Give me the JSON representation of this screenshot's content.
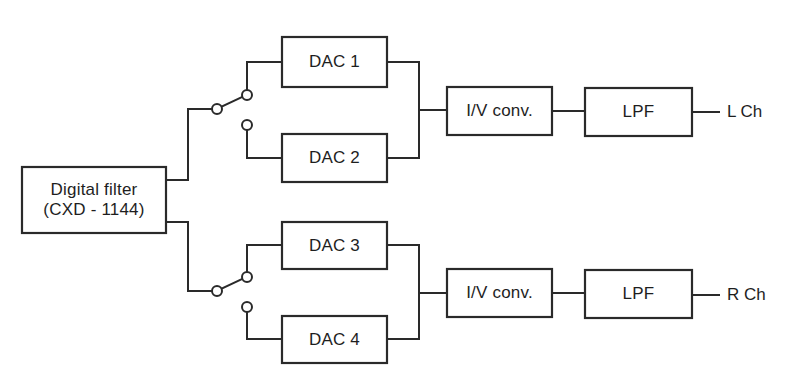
{
  "diagram": {
    "type": "block-diagram",
    "colors": {
      "line": "#2a2a2a",
      "text": "#1e1e1e",
      "background": "#ffffff"
    },
    "blocks": {
      "digital_filter": {
        "line1": "Digital filter",
        "line2": "(CXD - 1144)"
      },
      "dac1": {
        "label": "DAC 1"
      },
      "dac2": {
        "label": "DAC 2"
      },
      "dac3": {
        "label": "DAC 3"
      },
      "dac4": {
        "label": "DAC 4"
      },
      "iv_left": {
        "label": "I/V conv."
      },
      "iv_right": {
        "label": "I/V conv."
      },
      "lpf_left": {
        "label": "LPF"
      },
      "lpf_right": {
        "label": "LPF"
      }
    },
    "outputs": {
      "left": {
        "label": "L Ch"
      },
      "right": {
        "label": "R Ch"
      }
    },
    "switches": [
      {
        "name": "upper-switch",
        "position": "DAC 1",
        "contacts": [
          "DAC 1",
          "DAC 2"
        ]
      },
      {
        "name": "lower-switch",
        "position": "DAC 3",
        "contacts": [
          "DAC 3",
          "DAC 4"
        ]
      }
    ],
    "connections": [
      [
        "Digital filter",
        "upper-switch"
      ],
      [
        "Digital filter",
        "lower-switch"
      ],
      [
        "upper-switch",
        "DAC 1"
      ],
      [
        "upper-switch",
        "DAC 2"
      ],
      [
        "lower-switch",
        "DAC 3"
      ],
      [
        "lower-switch",
        "DAC 4"
      ],
      [
        "DAC 1",
        "I/V conv. (L)"
      ],
      [
        "DAC 2",
        "I/V conv. (L)"
      ],
      [
        "DAC 3",
        "I/V conv. (R)"
      ],
      [
        "DAC 4",
        "I/V conv. (R)"
      ],
      [
        "I/V conv. (L)",
        "LPF (L)"
      ],
      [
        "I/V conv. (R)",
        "LPF (R)"
      ],
      [
        "LPF (L)",
        "L Ch"
      ],
      [
        "LPF (R)",
        "R Ch"
      ]
    ]
  }
}
